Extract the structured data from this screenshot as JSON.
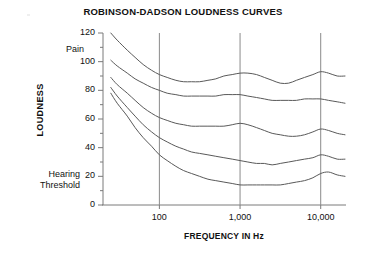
{
  "chart_data": {
    "type": "line",
    "title": "ROBINSON-DADSON LOUDNESS CURVES",
    "xlabel": "FREQUENCY IN Hz",
    "ylabel": "LOUDNESS",
    "xscale": "log",
    "xlim": [
      20,
      20000
    ],
    "ylim": [
      0,
      120
    ],
    "yticks": [
      0,
      20,
      40,
      60,
      80,
      100,
      120
    ],
    "ytick_labels": [
      "0",
      "20",
      "40",
      "60",
      "80",
      "100",
      "120"
    ],
    "yminor_step": 10,
    "xticks": [
      100,
      1000,
      10000
    ],
    "xtick_labels": [
      "100",
      "1,000",
      "10,000"
    ],
    "grid": "vertical-only",
    "legend": "none",
    "annotations": [
      {
        "text": "Pain",
        "position": "left-top",
        "value_approx": 110
      },
      {
        "text": "Hearing\nThreshold",
        "position": "left-bottom",
        "value_approx": 20
      }
    ],
    "series": [
      {
        "name": "120 phon",
        "x": [
          25,
          30,
          40,
          50,
          63,
          80,
          100,
          125,
          160,
          200,
          250,
          315,
          400,
          500,
          630,
          800,
          1000,
          1250,
          1600,
          2000,
          2500,
          3150,
          4000,
          5000,
          6300,
          8000,
          10000,
          12500,
          16000,
          20000
        ],
        "values": [
          120,
          115,
          108,
          103,
          98,
          94,
          91,
          89,
          87,
          86,
          86,
          86,
          87,
          88,
          90,
          91,
          92,
          92,
          91,
          89,
          87,
          85,
          85,
          87,
          89,
          91,
          93,
          92,
          90,
          90
        ]
      },
      {
        "name": "100 phon",
        "x": [
          25,
          30,
          40,
          50,
          63,
          80,
          100,
          125,
          160,
          200,
          250,
          315,
          400,
          500,
          630,
          800,
          1000,
          1250,
          1600,
          2000,
          2500,
          3150,
          4000,
          5000,
          6300,
          8000,
          10000,
          12500,
          16000,
          20000
        ],
        "values": [
          101,
          97,
          92,
          88,
          85,
          82,
          80,
          78,
          77,
          76,
          76,
          76,
          76,
          76,
          77,
          77,
          77,
          76,
          75,
          74,
          73,
          73,
          73,
          73,
          74,
          74,
          74,
          73,
          72,
          71
        ]
      },
      {
        "name": "80 phon",
        "x": [
          25,
          30,
          40,
          50,
          63,
          80,
          100,
          125,
          160,
          200,
          250,
          315,
          400,
          500,
          630,
          800,
          1000,
          1250,
          1600,
          2000,
          2500,
          3150,
          4000,
          5000,
          6300,
          8000,
          10000,
          12500,
          16000,
          20000
        ],
        "values": [
          89,
          84,
          78,
          73,
          68,
          64,
          61,
          59,
          57,
          56,
          55,
          55,
          55,
          55,
          55,
          56,
          57,
          56,
          54,
          52,
          50,
          49,
          48,
          48,
          49,
          51,
          53,
          52,
          50,
          49
        ]
      },
      {
        "name": "60 phon",
        "x": [
          25,
          30,
          40,
          50,
          63,
          80,
          100,
          125,
          160,
          200,
          250,
          315,
          400,
          500,
          630,
          800,
          1000,
          1250,
          1600,
          2000,
          2500,
          3150,
          4000,
          5000,
          6300,
          8000,
          10000,
          12500,
          16000,
          20000
        ],
        "values": [
          82,
          76,
          68,
          62,
          56,
          51,
          47,
          44,
          41,
          39,
          37,
          36,
          35,
          34,
          33,
          32,
          31,
          30,
          29,
          29,
          28,
          29,
          30,
          31,
          32,
          33,
          35,
          34,
          32,
          32
        ]
      },
      {
        "name": "Threshold",
        "x": [
          25,
          30,
          40,
          50,
          63,
          80,
          100,
          125,
          160,
          200,
          250,
          315,
          400,
          500,
          630,
          800,
          1000,
          1250,
          1600,
          2000,
          2500,
          3150,
          4000,
          5000,
          6300,
          8000,
          10000,
          12500,
          16000,
          20000
        ],
        "values": [
          78,
          71,
          62,
          54,
          47,
          41,
          35,
          31,
          27,
          24,
          22,
          20,
          18,
          17,
          16,
          15,
          14,
          14,
          14,
          14,
          14,
          14,
          15,
          16,
          17,
          19,
          22,
          23,
          21,
          20
        ]
      }
    ]
  },
  "style": {
    "curve_color": "#595959",
    "axis_color": "#7a7a7a",
    "grid_color": "#8a8a8a",
    "text_color": "#111111",
    "background": "#ffffff"
  }
}
